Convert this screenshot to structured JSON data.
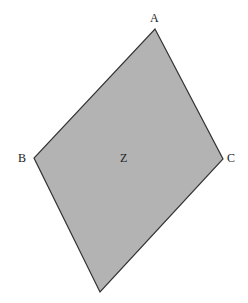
{
  "diagram": {
    "type": "quadrilateral",
    "fill_color": "#b3b3b3",
    "stroke_color": "#333333",
    "vertices": [
      {
        "name": "A",
        "x": 155,
        "y": 29
      },
      {
        "name": "C",
        "x": 223,
        "y": 159
      },
      {
        "name": "",
        "x": 100,
        "y": 292
      },
      {
        "name": "B",
        "x": 34,
        "y": 158
      }
    ],
    "labels": {
      "A": "A",
      "B": "B",
      "C": "C",
      "center": "Z"
    }
  }
}
